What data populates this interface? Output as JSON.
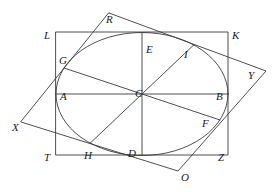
{
  "figure": {
    "stroke_color": "#3a3a3a",
    "label_color": "#1a1a1a",
    "background": "#ffffff",
    "width": 279,
    "height": 192
  },
  "shapes": {
    "axis_rectangle": {
      "name": "LKZT",
      "left": 56,
      "top": 32,
      "right": 228,
      "bottom": 155,
      "corner_labels": [
        "L",
        "K",
        "Z",
        "T"
      ]
    },
    "ellipse": {
      "center_x": 142,
      "center_y": 94,
      "radius_x": 86,
      "radius_y": 61.5
    },
    "tilted_rectangle": {
      "name": "RYOX",
      "vertices": [
        {
          "label": "R",
          "x": 109,
          "y": 13
        },
        {
          "label": "Y",
          "x": 266,
          "y": 71
        },
        {
          "label": "O",
          "x": 178,
          "y": 171
        },
        {
          "label": "X",
          "x": 21,
          "y": 122
        }
      ]
    },
    "chords": [
      {
        "name": "chord-A-B",
        "from": "A",
        "to": "B"
      },
      {
        "name": "chord-E-D",
        "from": "E",
        "to": "D"
      },
      {
        "name": "chord-G-F",
        "from": "G",
        "to": "F"
      },
      {
        "name": "chord-I-H",
        "from": "I",
        "to": "H"
      }
    ]
  },
  "points": [
    {
      "id": "L",
      "label": "L",
      "lx": 44,
      "ly": 30,
      "role": "rect-corner-top-left"
    },
    {
      "id": "K",
      "label": "K",
      "lx": 232,
      "ly": 30,
      "role": "rect-corner-top-right"
    },
    {
      "id": "T",
      "label": "T",
      "lx": 44,
      "ly": 152,
      "role": "rect-corner-bottom-left"
    },
    {
      "id": "Z",
      "label": "Z",
      "lx": 218,
      "ly": 152,
      "role": "rect-corner-bottom-right"
    },
    {
      "id": "R",
      "label": "R",
      "lx": 106,
      "ly": 14,
      "role": "tilted-corner-top"
    },
    {
      "id": "Y",
      "label": "Y",
      "lx": 248,
      "ly": 70,
      "role": "tilted-corner-right"
    },
    {
      "id": "O",
      "label": "O",
      "lx": 181,
      "ly": 172,
      "role": "tilted-corner-bottom"
    },
    {
      "id": "X",
      "label": "X",
      "lx": 12,
      "ly": 122,
      "role": "tilted-corner-left"
    },
    {
      "id": "C",
      "label": "C",
      "lx": 135,
      "ly": 88,
      "role": "ellipse-center"
    },
    {
      "id": "A",
      "label": "A",
      "lx": 60,
      "ly": 91,
      "role": "ellipse-point-left"
    },
    {
      "id": "B",
      "label": "B",
      "lx": 216,
      "ly": 91,
      "role": "ellipse-point-right"
    },
    {
      "id": "E",
      "label": "E",
      "lx": 146,
      "ly": 44,
      "role": "ellipse-point-top"
    },
    {
      "id": "D",
      "label": "D",
      "lx": 128,
      "ly": 148,
      "role": "ellipse-point-bottom"
    },
    {
      "id": "G",
      "label": "G",
      "lx": 59,
      "ly": 55,
      "role": "ellipse-tangency-upper-left"
    },
    {
      "id": "I",
      "label": "I",
      "lx": 184,
      "ly": 49,
      "role": "ellipse-tangency-upper-right"
    },
    {
      "id": "F",
      "label": "F",
      "lx": 202,
      "ly": 118,
      "role": "ellipse-tangency-lower-right"
    },
    {
      "id": "H",
      "label": "H",
      "lx": 84,
      "ly": 150,
      "role": "ellipse-tangency-lower-left"
    }
  ]
}
